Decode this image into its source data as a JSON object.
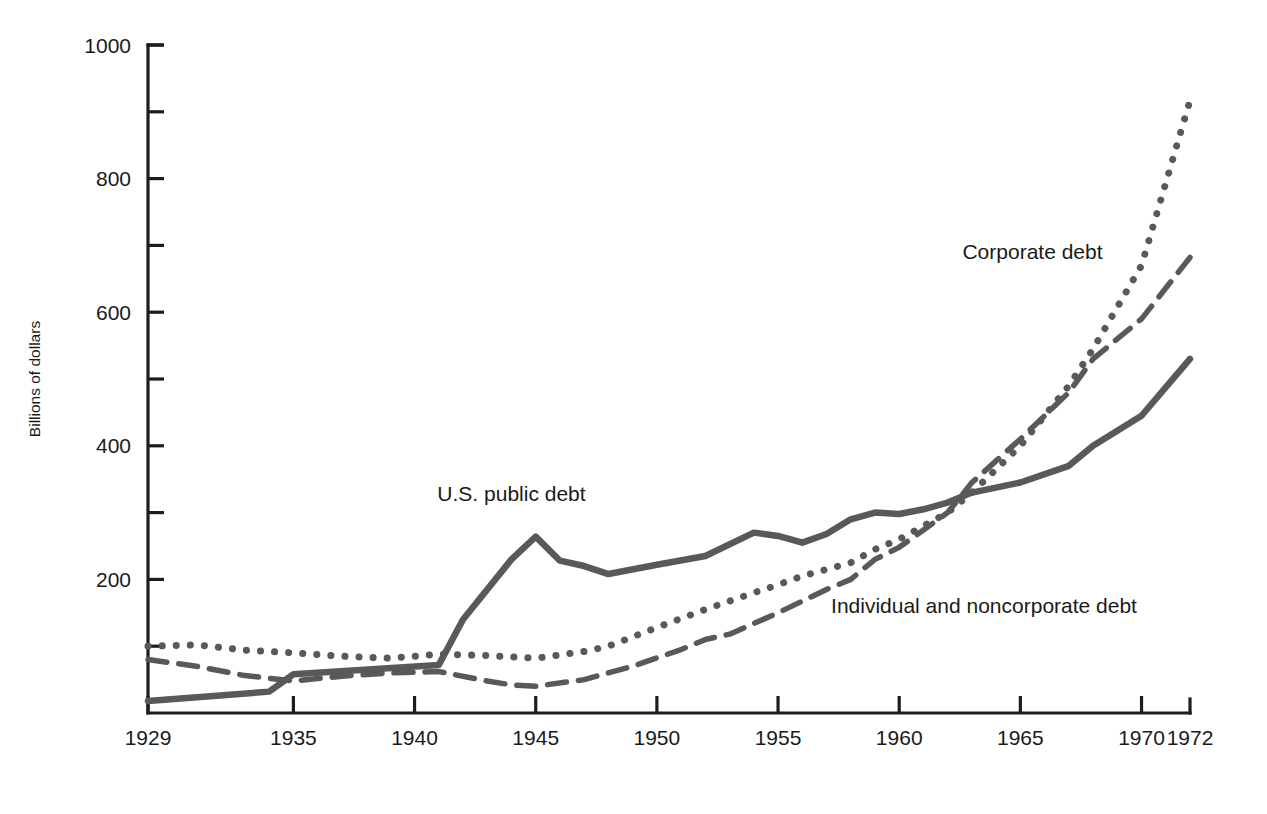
{
  "chart_data": {
    "type": "line",
    "title": "",
    "xlabel": "",
    "ylabel": "Billions of dollars",
    "xlim": [
      1929,
      1972
    ],
    "ylim": [
      0,
      1000
    ],
    "grid": false,
    "legend_position": "inline-annotations",
    "y_ticks_major": [
      0,
      200,
      400,
      600,
      800,
      1000
    ],
    "y_tick_labels": [
      "",
      "200",
      "400",
      "600",
      "800",
      "1000"
    ],
    "y_ticks_minor": [
      100,
      300,
      500,
      700,
      900
    ],
    "x_ticks": [
      1929,
      1935,
      1940,
      1945,
      1950,
      1955,
      1960,
      1965,
      1970,
      1972
    ],
    "x_tick_labels": [
      "1929",
      "1935",
      "1940",
      "1945",
      "1950",
      "1955",
      "1960",
      "1965",
      "1970",
      "1972"
    ],
    "series": [
      {
        "name": "U.S. public debt",
        "style": "solid",
        "color": "#595959",
        "x": [
          1929,
          1934,
          1935,
          1941,
          1942,
          1944,
          1945,
          1946,
          1947,
          1948,
          1950,
          1952,
          1954,
          1955,
          1956,
          1957,
          1958,
          1959,
          1960,
          1961,
          1962,
          1963,
          1965,
          1967,
          1968,
          1970,
          1972
        ],
        "values": [
          18,
          32,
          58,
          72,
          140,
          230,
          264,
          228,
          220,
          208,
          222,
          235,
          270,
          265,
          255,
          268,
          290,
          300,
          298,
          305,
          315,
          330,
          345,
          370,
          400,
          445,
          530
        ]
      },
      {
        "name": "Corporate debt",
        "style": "dotted",
        "color": "#595959",
        "x": [
          1929,
          1931,
          1933,
          1935,
          1937,
          1939,
          1941,
          1943,
          1945,
          1947,
          1948,
          1950,
          1952,
          1954,
          1955,
          1956,
          1958,
          1959,
          1960,
          1962,
          1963,
          1965,
          1967,
          1968,
          1970,
          1972
        ],
        "values": [
          100,
          102,
          94,
          90,
          85,
          82,
          88,
          86,
          82,
          92,
          100,
          128,
          155,
          180,
          192,
          205,
          225,
          245,
          260,
          300,
          330,
          400,
          490,
          545,
          670,
          917
        ]
      },
      {
        "name": "Individual and noncorporate debt",
        "style": "dashed",
        "color": "#595959",
        "x": [
          1929,
          1931,
          1933,
          1935,
          1937,
          1939,
          1941,
          1943,
          1944,
          1945,
          1947,
          1949,
          1951,
          1952,
          1953,
          1955,
          1957,
          1958,
          1959,
          1960,
          1962,
          1963,
          1965,
          1967,
          1968,
          1970,
          1972
        ],
        "values": [
          80,
          70,
          56,
          48,
          55,
          60,
          62,
          48,
          42,
          40,
          50,
          70,
          95,
          110,
          118,
          150,
          185,
          200,
          230,
          248,
          300,
          345,
          410,
          480,
          530,
          590,
          682
        ]
      }
    ],
    "annotations": [
      {
        "text": "Corporate debt",
        "x": 1965.5,
        "y": 680,
        "name": "corporate-debt-label"
      },
      {
        "text": "U.S. public debt",
        "x": 1944.0,
        "y": 318,
        "name": "us-public-debt-label"
      },
      {
        "text": "Individual and noncorporate debt",
        "x": 1963.5,
        "y": 150,
        "name": "individual-noncorporate-debt-label"
      }
    ]
  },
  "axes": {
    "y_title": "Billions of dollars",
    "y_labels": [
      "1000",
      "800",
      "600",
      "400",
      "200"
    ],
    "x_labels": [
      "1929",
      "1935",
      "1940",
      "1945",
      "1950",
      "1955",
      "1960",
      "1965",
      "1970",
      "1972"
    ]
  },
  "colors": {
    "line": "#595959",
    "axis": "#1d1d1d",
    "background": "#ffffff",
    "text": "#1a1a1a"
  }
}
